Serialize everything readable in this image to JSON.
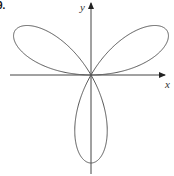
{
  "figure": {
    "number_label": "9.",
    "x_axis_label": "x",
    "y_axis_label": "y",
    "curve": "three-petal rose",
    "equation_form": "r = a sin(3θ)",
    "petal_directions_deg": [
      30,
      150,
      270
    ],
    "colors": {
      "curve": "#555555",
      "axes": "#444444",
      "background": "#ffffff"
    }
  }
}
